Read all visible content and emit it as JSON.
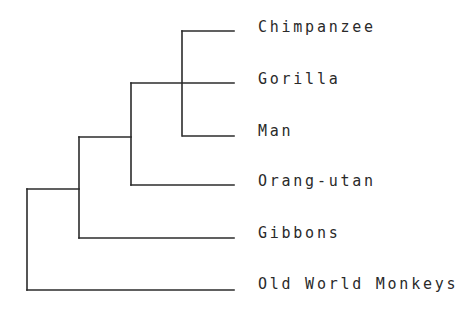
{
  "diagram": {
    "type": "phylogenetic-tree",
    "line_color": "#2b2b2b",
    "text_color": "#2a2a2a",
    "leaves": [
      {
        "label": "Chimpanzee",
        "y": 31
      },
      {
        "label": "Gorilla",
        "y": 83
      },
      {
        "label": "Man",
        "y": 136
      },
      {
        "label": "Orang-utan",
        "y": 185
      },
      {
        "label": "Gibbons",
        "y": 238
      },
      {
        "label": "Old World Monkeys",
        "y": 289
      }
    ],
    "clades": [
      {
        "name": "chimp-gorilla-man",
        "members": [
          "Chimpanzee",
          "Gorilla",
          "Man"
        ]
      },
      {
        "name": "great-apes",
        "members": [
          "Chimpanzee",
          "Gorilla",
          "Man",
          "Orang-utan"
        ]
      },
      {
        "name": "apes",
        "members": [
          "Chimpanzee",
          "Gorilla",
          "Man",
          "Orang-utan",
          "Gibbons"
        ]
      },
      {
        "name": "root",
        "members": [
          "Chimpanzee",
          "Gorilla",
          "Man",
          "Orang-utan",
          "Gibbons",
          "Old World Monkeys"
        ]
      }
    ]
  }
}
